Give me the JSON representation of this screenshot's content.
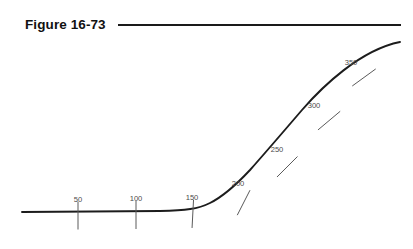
{
  "figure": {
    "title": "Figure 16-73",
    "title_rule": {
      "x1": 118,
      "y1": 25,
      "x2": 401,
      "y2": 25,
      "color": "#1a1a1a",
      "width": 2.2
    }
  },
  "chart_data": {
    "type": "line",
    "title": "Figure 16-73",
    "xlabel": "",
    "ylabel": "",
    "curve": {
      "color": "#1c1c1c",
      "width": 1.9,
      "path": "M 22 212 L 160 211 C 186 210.5 198 209 210 203 C 224 196 236 185 250 170 C 266 152 284 131 302 110 C 322 87 360 50 400 42",
      "start": {
        "x": 22,
        "y": 212
      },
      "end": {
        "x": 400,
        "y": 42
      }
    },
    "x": [
      50,
      100,
      150,
      200,
      250,
      300,
      350
    ],
    "tick_labels": [
      "50",
      "100",
      "150",
      "200",
      "250",
      "300",
      "350"
    ],
    "stations": [
      {
        "label": "50",
        "x": 78,
        "y": 211.5,
        "angle_deg": 0,
        "label_x": 78,
        "label_y": 202,
        "up": 10,
        "down": 18
      },
      {
        "label": "100",
        "x": 136,
        "y": 211,
        "angle_deg": 0,
        "label_x": 136,
        "label_y": 201,
        "up": 10,
        "down": 18
      },
      {
        "label": "150",
        "x": 193,
        "y": 210,
        "angle_deg": 3,
        "label_x": 192,
        "label_y": 200,
        "up": 10,
        "down": 18
      },
      {
        "label": "200",
        "x": 245,
        "y": 200,
        "angle_deg": 27,
        "label_x": 238,
        "label_y": 186,
        "up": 11,
        "down": 17
      },
      {
        "label": "250",
        "x": 289,
        "y": 165,
        "angle_deg": 45,
        "label_x": 277,
        "label_y": 152,
        "up": 12,
        "down": 17
      },
      {
        "label": "300",
        "x": 331,
        "y": 119,
        "angle_deg": 50,
        "label_x": 314,
        "label_y": 108,
        "up": 12,
        "down": 17
      },
      {
        "label": "350",
        "x": 366,
        "y": 76,
        "angle_deg": 54,
        "label_x": 351,
        "label_y": 65,
        "up": 12,
        "down": 17
      }
    ],
    "tick_style": {
      "color": "#5a5a5a",
      "width": 1.0
    },
    "grid": false,
    "legend": false
  }
}
